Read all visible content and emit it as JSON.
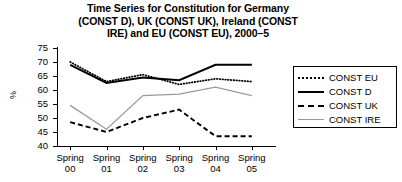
{
  "chart_data": {
    "type": "line",
    "title": "Time Series for Constitution for Germany (CONST D), UK (CONST UK), Ireland (CONST IRE) and EU (CONST EU), 2000–5",
    "title_lines": [
      "Time Series for Constitution for Germany",
      "(CONST D), UK (CONST UK), Ireland (CONST",
      "IRE) and EU (CONST EU), 2000–5"
    ],
    "xlabel": "",
    "ylabel": "%",
    "categories": [
      "Spring 00",
      "Spring 01",
      "Spring 02",
      "Spring 03",
      "Spring 04",
      "Spring 05"
    ],
    "category_lines": [
      [
        "Spring",
        "00"
      ],
      [
        "Spring",
        "01"
      ],
      [
        "Spring",
        "02"
      ],
      [
        "Spring",
        "03"
      ],
      [
        "Spring",
        "04"
      ],
      [
        "Spring",
        "05"
      ]
    ],
    "ylim": [
      40,
      75
    ],
    "yticks": [
      75,
      70,
      65,
      60,
      55,
      50,
      45,
      40
    ],
    "grid": false,
    "legend_position": "right",
    "series": [
      {
        "name": "CONST EU",
        "style": "dotted",
        "color": "#000000",
        "values": [
          70,
          63,
          65.5,
          62,
          64,
          63
        ]
      },
      {
        "name": "CONST D",
        "style": "solid",
        "color": "#000000",
        "values": [
          69,
          62.5,
          64.5,
          63.5,
          69,
          69
        ]
      },
      {
        "name": "CONST UK",
        "style": "dashed",
        "color": "#000000",
        "values": [
          48.5,
          45,
          50,
          53,
          43.5,
          43.5
        ]
      },
      {
        "name": "CONST IRE",
        "style": "solid-gray",
        "color": "#9a9a9a",
        "values": [
          54.5,
          46,
          58,
          58.5,
          61,
          58
        ]
      }
    ]
  }
}
